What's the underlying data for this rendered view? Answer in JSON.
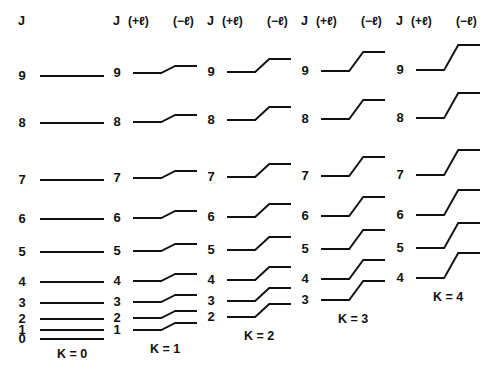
{
  "figure": {
    "width": 504,
    "height": 373,
    "background": "#ffffff",
    "line_color": "#111111",
    "text_color": "#111111"
  },
  "headers": {
    "j_label": "J",
    "plus_l_label": "(+ℓ)",
    "minus_l_label": "(−ℓ)"
  },
  "chart_data": {
    "type": "line",
    "xlabel": "",
    "ylabel": "",
    "grid": false,
    "legend_position": "none",
    "axis_note": "Vertical position represents relative energy; no numeric energy axis is drawn.",
    "j_axis_label": "J",
    "sublevel_labels": [
      "(+ℓ)",
      "(−ℓ)"
    ],
    "columns": [
      {
        "k_label": "K = 0",
        "k_value": 0,
        "has_splitting": false,
        "headers": [
          "J"
        ],
        "j_values": [
          9,
          8,
          7,
          6,
          5,
          4,
          3,
          2,
          1,
          0
        ],
        "levels": [
          {
            "J": 9,
            "y": 76,
            "split": 0
          },
          {
            "J": 8,
            "y": 123,
            "split": 0
          },
          {
            "J": 7,
            "y": 180,
            "split": 0
          },
          {
            "J": 6,
            "y": 219,
            "split": 0
          },
          {
            "J": 5,
            "y": 252,
            "split": 0
          },
          {
            "J": 4,
            "y": 282,
            "split": 0
          },
          {
            "J": 3,
            "y": 303,
            "split": 0
          },
          {
            "J": 2,
            "y": 319,
            "split": 0
          },
          {
            "J": 1,
            "y": 330,
            "split": 0
          },
          {
            "J": 0,
            "y": 339,
            "split": 0
          }
        ]
      },
      {
        "k_label": "K = 1",
        "k_value": 1,
        "has_splitting": true,
        "headers": [
          "J",
          "(+ℓ)",
          "(−ℓ)"
        ],
        "j_values": [
          9,
          8,
          7,
          6,
          5,
          4,
          3,
          2,
          1
        ],
        "levels": [
          {
            "J": 9,
            "y": 73,
            "split": 7
          },
          {
            "J": 8,
            "y": 122,
            "split": 7
          },
          {
            "J": 7,
            "y": 178,
            "split": 7
          },
          {
            "J": 6,
            "y": 218,
            "split": 7
          },
          {
            "J": 5,
            "y": 251,
            "split": 7
          },
          {
            "J": 4,
            "y": 281,
            "split": 7
          },
          {
            "J": 3,
            "y": 302,
            "split": 7
          },
          {
            "J": 2,
            "y": 318,
            "split": 7
          },
          {
            "J": 1,
            "y": 330,
            "split": 7
          }
        ]
      },
      {
        "k_label": "K = 2",
        "k_value": 2,
        "has_splitting": true,
        "headers": [
          "J",
          "(+ℓ)",
          "(−ℓ)"
        ],
        "j_values": [
          9,
          8,
          7,
          6,
          5,
          4,
          3,
          2
        ],
        "levels": [
          {
            "J": 9,
            "y": 72,
            "split": 13
          },
          {
            "J": 8,
            "y": 120,
            "split": 13
          },
          {
            "J": 7,
            "y": 177,
            "split": 13
          },
          {
            "J": 6,
            "y": 217,
            "split": 13
          },
          {
            "J": 5,
            "y": 250,
            "split": 13
          },
          {
            "J": 4,
            "y": 280,
            "split": 13
          },
          {
            "J": 3,
            "y": 301,
            "split": 13
          },
          {
            "J": 2,
            "y": 317,
            "split": 13
          }
        ]
      },
      {
        "k_label": "K = 3",
        "k_value": 3,
        "has_splitting": true,
        "headers": [
          "J",
          "(+ℓ)",
          "(−ℓ)"
        ],
        "j_values": [
          9,
          8,
          7,
          6,
          5,
          4,
          3
        ],
        "levels": [
          {
            "J": 9,
            "y": 71,
            "split": 19
          },
          {
            "J": 8,
            "y": 119,
            "split": 19
          },
          {
            "J": 7,
            "y": 176,
            "split": 19
          },
          {
            "J": 6,
            "y": 216,
            "split": 19
          },
          {
            "J": 5,
            "y": 249,
            "split": 19
          },
          {
            "J": 4,
            "y": 279,
            "split": 19
          },
          {
            "J": 3,
            "y": 300,
            "split": 19
          }
        ]
      },
      {
        "k_label": "K = 4",
        "k_value": 4,
        "has_splitting": true,
        "headers": [
          "J",
          "(+ℓ)",
          "(−ℓ)"
        ],
        "j_values": [
          9,
          8,
          7,
          6,
          5,
          4
        ],
        "levels": [
          {
            "J": 9,
            "y": 70,
            "split": 25
          },
          {
            "J": 8,
            "y": 118,
            "split": 25
          },
          {
            "J": 7,
            "y": 175,
            "split": 25
          },
          {
            "J": 6,
            "y": 215,
            "split": 25
          },
          {
            "J": 5,
            "y": 248,
            "split": 25
          },
          {
            "J": 4,
            "y": 278,
            "split": 25
          }
        ]
      }
    ]
  },
  "layout": {
    "header_y": 25,
    "columns": [
      {
        "num_x": 22,
        "line_x0": 40,
        "line_x1": 104,
        "j_hdr_x": 18,
        "plus_hdr_x": null,
        "minus_hdr_x": null,
        "k_x": 72,
        "k_y": 358
      },
      {
        "num_x": 117,
        "line_x0": 133,
        "line_x1": 197,
        "j_hdr_x": 113,
        "plus_hdr_x": 128,
        "minus_hdr_x": 173,
        "k_x": 165,
        "k_y": 353
      },
      {
        "num_x": 211,
        "line_x0": 227,
        "line_x1": 291,
        "j_hdr_x": 207,
        "plus_hdr_x": 222,
        "minus_hdr_x": 267,
        "k_x": 259,
        "k_y": 340
      },
      {
        "num_x": 305,
        "line_x0": 321,
        "line_x1": 385,
        "j_hdr_x": 301,
        "plus_hdr_x": 316,
        "minus_hdr_x": 361,
        "k_x": 353,
        "k_y": 323
      },
      {
        "num_x": 400,
        "line_x0": 416,
        "line_x1": 480,
        "j_hdr_x": 396,
        "plus_hdr_x": 411,
        "minus_hdr_x": 456,
        "k_x": 448,
        "k_y": 301
      }
    ]
  }
}
